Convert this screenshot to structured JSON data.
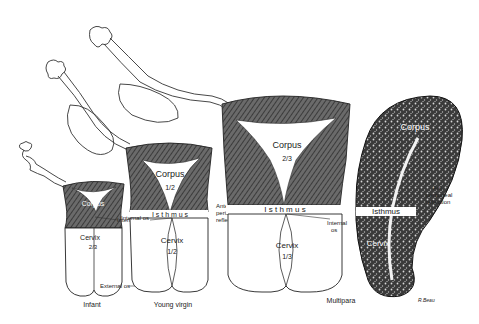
{
  "diagram": {
    "colors": {
      "ink": "#222222",
      "shade": "#555555",
      "paper": "#ffffff"
    },
    "specimens": [
      {
        "id": "infant",
        "caption": "Infant",
        "corpus_label": "Corpus",
        "corpus_fraction": "1/3",
        "cervix_label": "Cervix",
        "cervix_fraction": "2/3",
        "internal_os_label": "Internal os",
        "external_os_label": "External os"
      },
      {
        "id": "young-virgin",
        "caption": "Young virgin",
        "corpus_label": "Corpus",
        "corpus_fraction": "1/2",
        "isthmus_label": "I s t h m u s",
        "cervix_label": "Cervix",
        "cervix_fraction": "1/2",
        "internal_os_label": "Internal os",
        "external_os_label": "External os",
        "peritoneal_label_1": "Anterior",
        "peritoneal_label_2": "peritoneal",
        "peritoneal_label_3": "reflection"
      },
      {
        "id": "multipara",
        "caption": "Multipara",
        "corpus_label": "Corpus",
        "corpus_fraction": "2/3",
        "isthmus_label": "I s t h m u s",
        "cervix_label": "Cervix",
        "cervix_fraction": "1/3",
        "internal_os_label_1": "Internal",
        "internal_os_label_2": "os"
      },
      {
        "id": "sagittal-section",
        "corpus_label": "Corpus",
        "isthmus_label": "Isthmus",
        "cervix_label": "Cervix",
        "peritoneal_label_1": "Ant.",
        "peritoneal_label_2": "peritoneal",
        "peritoneal_label_3": "reflection",
        "signature": "R.Beau"
      }
    ]
  }
}
